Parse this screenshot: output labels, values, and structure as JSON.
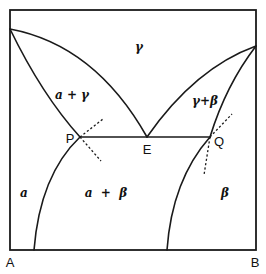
{
  "diagram": {
    "type": "binary eutectic phase diagram",
    "components": {
      "left": "A",
      "right": "B"
    },
    "points": {
      "p": "P",
      "e": "E",
      "q": "Q"
    },
    "phase_labels": {
      "gamma": "γ",
      "alpha_gamma": "a + γ",
      "gamma_beta": "γ+β",
      "alpha": "a",
      "alpha_beta": "a  +  β",
      "beta": "β"
    },
    "colors": {
      "ink": "#1a1a1a",
      "background": "#ffffff"
    }
  }
}
